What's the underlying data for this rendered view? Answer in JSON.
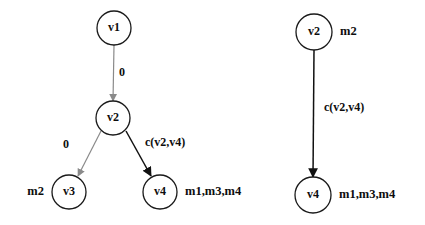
{
  "figure": {
    "background": "#ffffff",
    "colors": {
      "node_stroke": "#1a1a1a",
      "node_fill": "#ffffff",
      "text": "#0d0d0d",
      "edge_black": "#111111",
      "edge_gray": "#8a8a8a"
    },
    "panels": [
      {
        "id": "left-graph",
        "name": "left-graph-panel",
        "nodes": [
          {
            "id": "l-v1",
            "label": "v1",
            "cx": 114,
            "cy": 28,
            "r": 17,
            "side_label": "",
            "side_align": "start"
          },
          {
            "id": "l-v2",
            "label": "v2",
            "cx": 113,
            "cy": 118,
            "r": 17,
            "side_label": "",
            "side_align": "start"
          },
          {
            "id": "l-v3",
            "label": "v3",
            "cx": 69,
            "cy": 192,
            "r": 17,
            "side_label": "m2",
            "side_align": "end"
          },
          {
            "id": "l-v4",
            "label": "v4",
            "cx": 160,
            "cy": 192,
            "r": 17,
            "side_label": "m1,m3,m4",
            "side_align": "start"
          }
        ],
        "edges": [
          {
            "id": "l-e1",
            "from": "v1",
            "to": "v2",
            "label": "0",
            "color": "gray",
            "x1": 114,
            "y1": 45,
            "x2": 113,
            "y2": 101,
            "lx": 119,
            "ly": 73,
            "lalign": "start"
          },
          {
            "id": "l-e2",
            "from": "v2",
            "to": "v3",
            "label": "0",
            "color": "gray",
            "x1": 101,
            "y1": 131,
            "x2": 78,
            "y2": 176,
            "lx": 66,
            "ly": 145,
            "lalign": "middle"
          },
          {
            "id": "l-e3",
            "from": "v2",
            "to": "v4",
            "label": "c(v2,v4)",
            "color": "black",
            "x1": 126,
            "y1": 131,
            "x2": 151,
            "y2": 176,
            "lx": 145,
            "ly": 143,
            "lalign": "start"
          }
        ]
      },
      {
        "id": "right-graph",
        "name": "right-graph-panel",
        "nodes": [
          {
            "id": "r-v2",
            "label": "v2",
            "cx": 314,
            "cy": 32,
            "r": 18,
            "side_label": "m2",
            "side_align": "start"
          },
          {
            "id": "r-v4",
            "label": "v4",
            "cx": 313,
            "cy": 195,
            "r": 18,
            "side_label": "m1,m3,m4",
            "side_align": "start"
          }
        ],
        "edges": [
          {
            "id": "r-e1",
            "from": "v2",
            "to": "v4",
            "label": "c(v2,v4)",
            "color": "black",
            "x1": 314,
            "y1": 50,
            "x2": 313,
            "y2": 177,
            "lx": 324,
            "ly": 108,
            "lalign": "start"
          }
        ]
      }
    ]
  }
}
